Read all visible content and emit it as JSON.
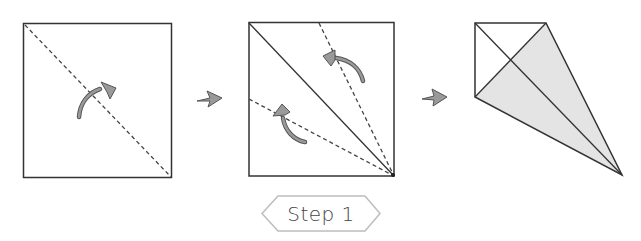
{
  "diagram": {
    "step_label": "Step 1",
    "colors": {
      "line": "#333333",
      "arrow_fill": "#9a9a9a",
      "arrow_stroke": "#555555",
      "shaded": "#e4e4e4",
      "label_border": "#bdbdbd"
    },
    "panels": [
      {
        "name": "square-with-diagonal-fold",
        "description": "Square with dashed diagonal fold line and curved fold arrow"
      },
      {
        "name": "square-with-kite-folds",
        "description": "Square with solid diagonal and two dashed lines from corner, two curved fold arrows"
      },
      {
        "name": "kite-base",
        "description": "Resulting kite shape with shaded folded flaps"
      }
    ]
  }
}
